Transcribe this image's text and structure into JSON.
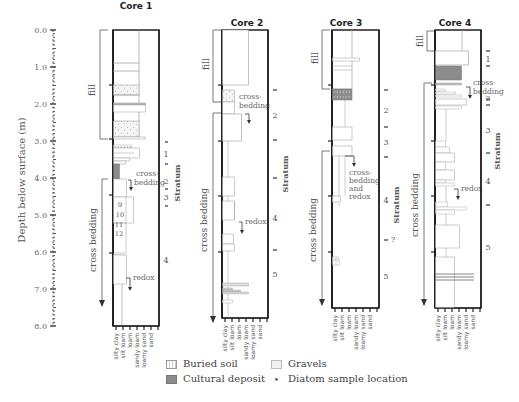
{
  "figure": {
    "y_axis_label": "Depth below surface (m)",
    "y_ticks": [
      "0.0",
      "1.0",
      "2.0",
      "3.0",
      "4.0",
      "5.0",
      "6.0",
      "7.0",
      "8.0"
    ],
    "x_texture_labels": [
      "silty clay",
      "silt loam",
      "loam",
      "sandy loam",
      "loamy sand",
      "sand"
    ],
    "stratum_label": "Stratum",
    "cores": [
      {
        "title": "Core 1",
        "bracket_labels": [
          "fill",
          "cross bedding"
        ],
        "annotations": [
          "cross-bedding",
          "redox"
        ],
        "strata": [
          "1",
          "2",
          "3",
          "4"
        ],
        "samples": [
          "9",
          "10",
          "11",
          "12"
        ]
      },
      {
        "title": "Core 2",
        "bracket_labels": [
          "fill",
          "cross bedding"
        ],
        "annotations": [
          "cross-bedding",
          "redox"
        ],
        "strata": [
          "2",
          "4",
          "5"
        ]
      },
      {
        "title": "Core 3",
        "bracket_labels": [
          "fill",
          "cross bedding"
        ],
        "annotations": [
          "cross-bedding and redox"
        ],
        "strata": [
          "2",
          "3",
          "4",
          "?",
          "5"
        ]
      },
      {
        "title": "Core 4",
        "bracket_labels": [
          "fill",
          "cross bedding"
        ],
        "annotations": [
          "cross-bedding",
          "redox"
        ],
        "strata": [
          "1",
          "2",
          "3",
          "4",
          "5"
        ]
      }
    ]
  },
  "legend": {
    "buried_soil": "Buried soil",
    "cultural_deposit": "Cultural deposit",
    "gravels": "Gravels",
    "diatom": "Diatom sample location"
  }
}
